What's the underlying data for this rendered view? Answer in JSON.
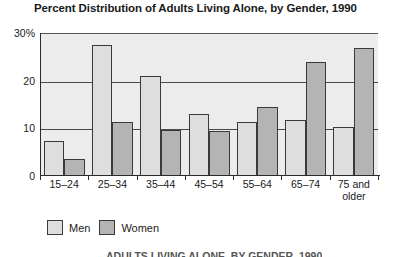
{
  "chart_data": {
    "type": "bar",
    "title": "Percent Distribution of Adults Living Alone, by Gender, 1990",
    "xlabel": "",
    "ylabel": "",
    "ylim": [
      0,
      30
    ],
    "yticks": [
      0,
      10,
      20,
      30
    ],
    "ytick_labels": [
      "0",
      "10",
      "20",
      "30%"
    ],
    "grid": true,
    "legend_position": "bottom-left",
    "categories": [
      "15–24",
      "25–34",
      "35–44",
      "45–54",
      "55–64",
      "65–74",
      "75 and older"
    ],
    "series": [
      {
        "name": "Men",
        "color": "#dedede",
        "values": [
          7.4,
          27.5,
          20.9,
          13.1,
          11.4,
          11.8,
          10.2
        ]
      },
      {
        "name": "Women",
        "color": "#b4b4b4",
        "values": [
          3.6,
          11.4,
          9.7,
          9.5,
          14.4,
          23.9,
          26.9
        ]
      }
    ]
  },
  "legend": {
    "items": [
      {
        "label": "Men"
      },
      {
        "label": "Women"
      }
    ]
  },
  "source_note": "ADULTS LIVING ALONE, BY GENDER, 1990",
  "colors": {
    "plot_background": "#ececec",
    "page_background": "#ffffff",
    "axis": "#2a2a2a",
    "gridline": "#4a4a4a",
    "men_fill": "#dedede",
    "women_fill": "#b4b4b4"
  }
}
